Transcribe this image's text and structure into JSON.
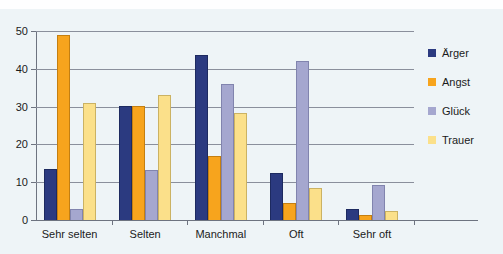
{
  "chart_data": {
    "type": "bar",
    "title": "",
    "xlabel": "",
    "ylabel": "",
    "categories": [
      "Sehr selten",
      "Selten",
      "Manchmal",
      "Oft",
      "Sehr oft"
    ],
    "series": [
      {
        "name": "Ärger",
        "color": "#2b3a80",
        "values": [
          13.5,
          30.2,
          43.7,
          12.5,
          3.0
        ]
      },
      {
        "name": "Angst",
        "color": "#f7a41d",
        "values": [
          49.0,
          30.2,
          17.0,
          4.4,
          1.2
        ]
      },
      {
        "name": "Glück",
        "color": "#a5a7cf",
        "values": [
          3.0,
          13.2,
          36.0,
          42.0,
          9.3
        ]
      },
      {
        "name": "Trauer",
        "color": "#fbe08a",
        "values": [
          30.9,
          33.2,
          28.4,
          8.4,
          2.3
        ]
      }
    ],
    "ylim": [
      0,
      50
    ],
    "y_ticks": [
      0,
      10,
      20,
      30,
      40,
      50
    ],
    "y_tick_labels": [
      "0",
      "10",
      "20",
      "30",
      "40",
      "50"
    ],
    "grid": true,
    "grid_axis": "y",
    "legend_position": "right",
    "background_color": "#eef4f7"
  },
  "legend": {
    "items": [
      {
        "label": "Ärger"
      },
      {
        "label": "Angst"
      },
      {
        "label": "Glück"
      },
      {
        "label": "Trauer"
      }
    ]
  }
}
